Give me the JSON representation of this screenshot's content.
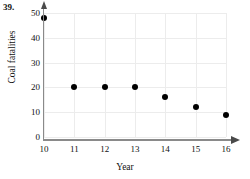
{
  "problem_number": "39.",
  "chart_data": {
    "type": "scatter",
    "title": "",
    "xlabel": "Year",
    "ylabel": "Coal fatalities",
    "x": [
      10,
      11,
      12,
      13,
      14,
      15,
      16
    ],
    "values": [
      48,
      20,
      20,
      20,
      16,
      12,
      9
    ],
    "points": [
      {
        "x": 10,
        "y": 48
      },
      {
        "x": 11,
        "y": 20
      },
      {
        "x": 12,
        "y": 20
      },
      {
        "x": 13,
        "y": 20
      },
      {
        "x": 14,
        "y": 16
      },
      {
        "x": 15,
        "y": 12
      },
      {
        "x": 16,
        "y": 9
      }
    ],
    "xlim": [
      10,
      16
    ],
    "ylim": [
      0,
      50
    ],
    "xticks": [
      10,
      11,
      12,
      13,
      14,
      15,
      16
    ],
    "yticks": [
      0,
      10,
      20,
      30,
      40,
      50
    ],
    "xtick_labels": [
      "10",
      "11",
      "12",
      "13",
      "14",
      "15",
      "16"
    ],
    "ytick_labels": [
      "0",
      "10",
      "20",
      "30",
      "40",
      "50"
    ],
    "grid": true,
    "legend": null,
    "marker_color": "#000000",
    "grid_color": "#ececec",
    "axis_color": "#8a8a8a"
  }
}
